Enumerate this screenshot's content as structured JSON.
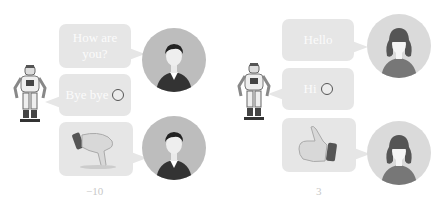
{
  "left_panel": {
    "bubbles": [
      {
        "text_line1": "How are",
        "text_line2": "you?",
        "speaker": "human"
      },
      {
        "text": "Bye bye",
        "emoji": "smiley-icon",
        "speaker": "robot"
      },
      {
        "icon": "thumbs-down-icon",
        "speaker": "human"
      }
    ],
    "human_avatar": "male-avatar",
    "score": "−10"
  },
  "right_panel": {
    "bubbles": [
      {
        "text": "Hello",
        "speaker": "human"
      },
      {
        "text": "Hi",
        "emoji": "smiley-icon",
        "speaker": "robot"
      },
      {
        "icon": "thumbs-up-icon",
        "speaker": "human"
      }
    ],
    "human_avatar": "female-avatar",
    "score": "3"
  },
  "colors": {
    "bubble": "#e6e6e6",
    "bubble_text": "#fbfbfb",
    "male_avatar_bg": "#bdbdbd",
    "female_avatar_bg": "#dadada",
    "score_text": "#c8c8c8"
  }
}
